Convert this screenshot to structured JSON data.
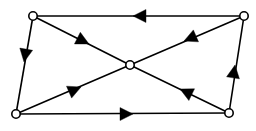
{
  "diagram": {
    "type": "directed-graph",
    "canvas": {
      "width": 256,
      "height": 131,
      "background": "#ffffff"
    },
    "style": {
      "edge_color": "#000000",
      "edge_width": 1.6,
      "node_fill": "#ffffff",
      "node_stroke": "#000000",
      "node_stroke_width": 1.6,
      "node_radius": 4.2,
      "arrow_color": "#000000",
      "arrow_length": 13,
      "arrow_half_width": 6.5
    },
    "nodes": [
      {
        "id": "top-left",
        "label": "",
        "x": 33,
        "y": 16
      },
      {
        "id": "top-right",
        "label": "",
        "x": 244,
        "y": 16
      },
      {
        "id": "center",
        "label": "",
        "x": 130,
        "y": 65
      },
      {
        "id": "bottom-left",
        "label": "",
        "x": 16,
        "y": 114
      },
      {
        "id": "bottom-right",
        "label": "",
        "x": 229,
        "y": 113
      }
    ],
    "edges": [
      {
        "id": "edge-top",
        "from": "top-right",
        "to": "top-left",
        "x1": 244,
        "y1": 16,
        "x2": 33,
        "y2": 16,
        "arrow_at": {
          "x": 133,
          "y": 16
        },
        "direction": "left"
      },
      {
        "id": "edge-left",
        "from": "top-left",
        "to": "bottom-left",
        "x1": 33,
        "y1": 16,
        "x2": 16,
        "y2": 114,
        "arrow_at": {
          "x": 24,
          "y": 62
        },
        "direction": "down"
      },
      {
        "id": "edge-bottom",
        "from": "bottom-left",
        "to": "bottom-right",
        "x1": 16,
        "y1": 114,
        "x2": 229,
        "y2": 113,
        "arrow_at": {
          "x": 133,
          "y": 114
        },
        "direction": "right"
      },
      {
        "id": "edge-right",
        "from": "bottom-right",
        "to": "top-right",
        "x1": 229,
        "y1": 113,
        "x2": 244,
        "y2": 16,
        "arrow_at": {
          "x": 235,
          "y": 65
        },
        "direction": "up"
      },
      {
        "id": "edge-topleft-center",
        "from": "top-left",
        "to": "center",
        "x1": 33,
        "y1": 16,
        "x2": 130,
        "y2": 65,
        "arrow_at": {
          "x": 89,
          "y": 44
        },
        "direction": "down-right"
      },
      {
        "id": "edge-topright-center",
        "from": "top-right",
        "to": "center",
        "x1": 244,
        "y1": 16,
        "x2": 130,
        "y2": 65,
        "arrow_at": {
          "x": 184,
          "y": 41
        },
        "direction": "down-left"
      },
      {
        "id": "edge-bottomleft-center",
        "from": "bottom-left",
        "to": "center",
        "x1": 16,
        "y1": 114,
        "x2": 130,
        "y2": 65,
        "arrow_at": {
          "x": 81,
          "y": 87
        },
        "direction": "up-right"
      },
      {
        "id": "edge-bottomright-center",
        "from": "bottom-right",
        "to": "center",
        "x1": 229,
        "y1": 113,
        "x2": 130,
        "y2": 65,
        "arrow_at": {
          "x": 180,
          "y": 89
        },
        "direction": "up-left"
      }
    ]
  }
}
